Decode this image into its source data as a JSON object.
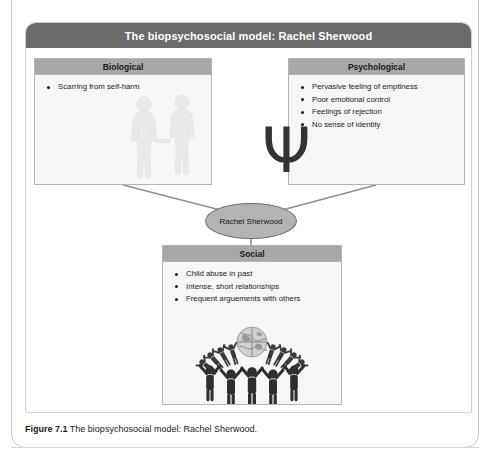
{
  "figure": {
    "title": "The biopsychosocial model: Rachel Sherwood",
    "caption_label": "Figure 7.1",
    "caption_text": " The biopsychosocial model: Rachel Sherwood.",
    "colors": {
      "title_bar": "#6b6b6b",
      "box_header": "#a8a8a8",
      "box_body": "#f6f6f6",
      "node_fill": "#b3b3b3",
      "border": "#b4b4b4",
      "text": "#1a1a1a",
      "title_text": "#ffffff"
    }
  },
  "center_node": {
    "label": "Rachel Sherwood"
  },
  "boxes": {
    "biological": {
      "header": "Biological",
      "items": [
        "Scarring from self-harm"
      ],
      "illustration": "two-human-figures-holding-hands"
    },
    "psychological": {
      "header": "Psychological",
      "items": [
        "Pervasive feeling of emptiness",
        "Poor emotional control",
        "Feelings of rejection",
        "No sense of identity"
      ],
      "illustration": "psi-symbol"
    },
    "social": {
      "header": "Social",
      "items": [
        "Child abuse in past",
        "Intense, short relationships",
        "Frequent arguements with others"
      ],
      "illustration": "globe-with-people-ring"
    }
  },
  "glyphs": {
    "psi": "Ψ"
  }
}
